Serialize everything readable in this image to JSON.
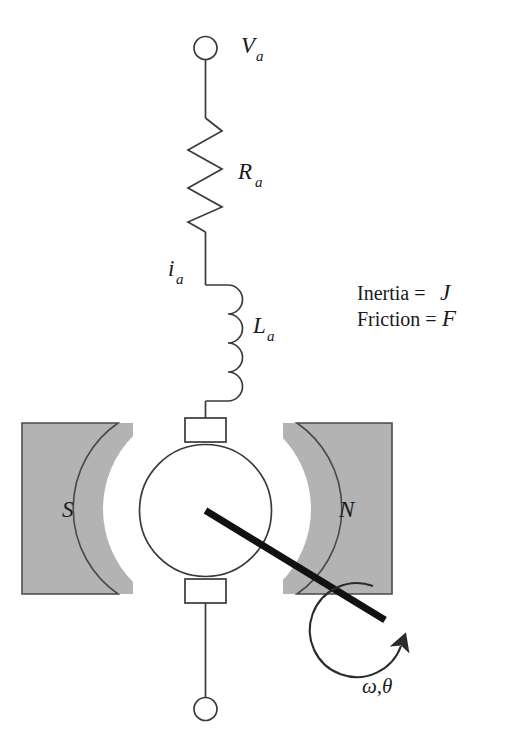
{
  "diagram": {
    "colors": {
      "stroke": "#3a3a3a",
      "shaft": "#111111",
      "magnet_fill": "#b3b3b3",
      "magnet_stroke": "#4a4a4a",
      "background": "#ffffff",
      "text": "#1a1a1a"
    },
    "labels": {
      "source_voltage": "V",
      "source_voltage_sub": "a",
      "resistance": "R",
      "resistance_sub": "a",
      "current": "i",
      "current_sub": "a",
      "inductance": "L",
      "inductance_sub": "a",
      "pole_south": "S",
      "pole_north": "N",
      "inertia_line": "Inertia = ",
      "inertia_symbol": "J",
      "friction_line": "Friction = ",
      "friction_symbol": "F",
      "rotation": "ω,θ"
    },
    "components": {
      "top_terminal": "open-terminal-node",
      "bottom_terminal": "open-terminal-node",
      "resistor": "zigzag-resistor",
      "inductor": "coil-inductor",
      "rotor": "armature-circle",
      "brush_top": "brush-block",
      "brush_bottom": "brush-block",
      "magnet_left": "stator-pole-south",
      "magnet_right": "stator-pole-north",
      "shaft": "output-shaft",
      "rotation_arrow": "curved-rotation-arrow"
    }
  }
}
